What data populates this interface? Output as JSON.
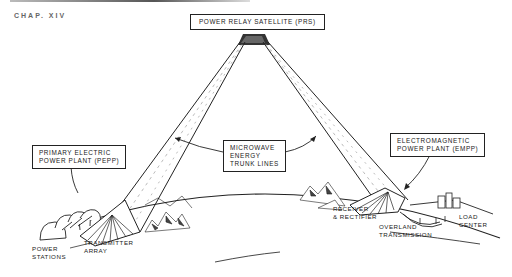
{
  "header": {
    "fragment_text": "CHAP. XIV"
  },
  "diagram": {
    "title_box": "POWER RELAY SATELLITE (PRS)",
    "left_plant_box": [
      "PRIMARY ELECTRIC",
      "POWER PLANT (PEPP)"
    ],
    "center_box": [
      "MICROWAVE",
      "ENERGY",
      "TRUNK LINES"
    ],
    "right_plant_box": [
      "ELECTROMAGNETIC",
      "POWER PLANT (EMPP)"
    ],
    "labels": {
      "power_stations": [
        "POWER",
        "STATIONS"
      ],
      "transmitter_array": [
        "TRANSMITTER",
        "ARRAY"
      ],
      "receiver_rectifier": [
        "RECEIVER",
        "& RECTIFIER"
      ],
      "overland_transmission": [
        "OVERLAND",
        "TRANSMISSION"
      ],
      "load_center": [
        "LOAD",
        "CENTER"
      ]
    }
  }
}
